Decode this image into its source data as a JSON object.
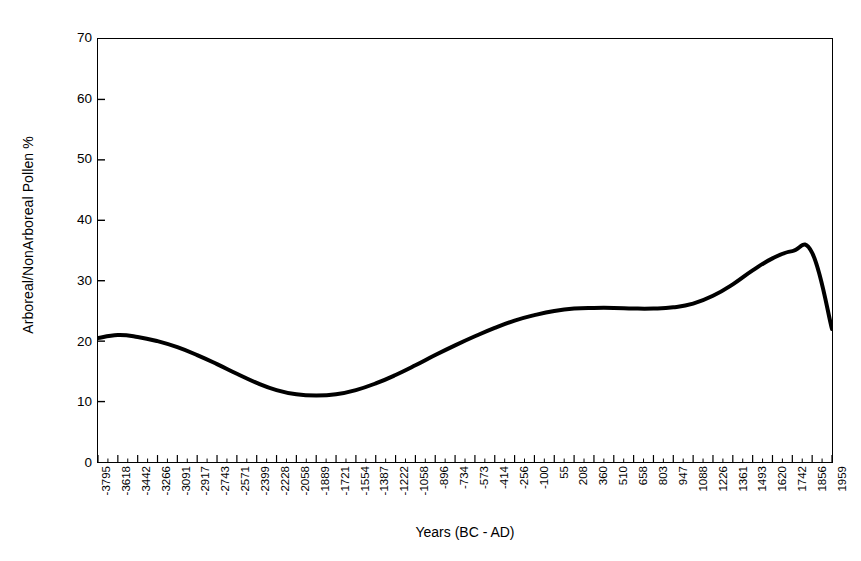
{
  "chart_data": {
    "type": "line",
    "title": "",
    "xlabel": "Years (BC - AD)",
    "ylabel": "Arboreal/NonArboreal Pollen %",
    "ylim": [
      0,
      70
    ],
    "y_ticks": [
      0,
      10,
      20,
      30,
      40,
      50,
      60,
      70
    ],
    "grid": false,
    "legend": "none",
    "x_tick_labels": [
      "-3795",
      "-3618",
      "-3442",
      "-3266",
      "-3091",
      "-2917",
      "-2743",
      "-2571",
      "-2399",
      "-2228",
      "-2058",
      "-1889",
      "-1721",
      "-1554",
      "-1387",
      "-1222",
      "-1058",
      "-896",
      "-734",
      "-573",
      "-414",
      "-256",
      "-100",
      "55",
      "208",
      "360",
      "510",
      "658",
      "803",
      "947",
      "1088",
      "1226",
      "1361",
      "1493",
      "1620",
      "1742",
      "1856",
      "1959"
    ],
    "x": [
      -3795,
      -3618,
      -3442,
      -3266,
      -3091,
      -2917,
      -2743,
      -2571,
      -2399,
      -2228,
      -2058,
      -1889,
      -1721,
      -1554,
      -1387,
      -1222,
      -1058,
      -896,
      -734,
      -573,
      -414,
      -256,
      -100,
      55,
      208,
      360,
      510,
      658,
      803,
      947,
      1088,
      1226,
      1361,
      1493,
      1620,
      1742,
      1856,
      1959
    ],
    "values": [
      20.5,
      21.0,
      20.7,
      20.0,
      19.0,
      17.7,
      16.2,
      14.6,
      13.1,
      11.9,
      11.2,
      11.0,
      11.2,
      11.9,
      13.0,
      14.4,
      16.0,
      17.7,
      19.3,
      20.8,
      22.2,
      23.4,
      24.3,
      25.0,
      25.4,
      25.5,
      25.5,
      25.4,
      25.4,
      25.6,
      26.2,
      27.5,
      29.4,
      31.7,
      33.7,
      34.9,
      34.6,
      22.0
    ],
    "series_name": "Arboreal/NonArboreal Pollen %",
    "line_color": "#000000",
    "line_width": 4,
    "notes": {
      "start_value": 20.5,
      "early_local_max": 21.0,
      "minimum_value": 11.0,
      "minimum_at": -1889,
      "plateau_value": 25.5,
      "peak_value": 35.0,
      "peak_at": 1620,
      "end_value": 22.0
    }
  },
  "axes": {
    "x_title": "Years (BC - AD)",
    "y_title": "Arboreal/NonArboreal Pollen %"
  },
  "colors": {
    "background": "#ffffff",
    "axis": "#000000",
    "curve": "#000000"
  }
}
